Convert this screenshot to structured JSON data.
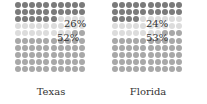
{
  "chart_data": {
    "type": "waffle",
    "grid": {
      "rows": 10,
      "cols": 10
    },
    "colors": {
      "dark": "#7a7a7a",
      "light": "#dcdcdc",
      "medium": "#a8a8a8"
    },
    "panels": [
      {
        "label": "Texas",
        "segments": [
          {
            "key": "dark",
            "value": 26
          },
          {
            "key": "light",
            "value": 22
          },
          {
            "key": "medium",
            "value": 52
          }
        ],
        "annotations": [
          "26%",
          "52%"
        ]
      },
      {
        "label": "Florida",
        "segments": [
          {
            "key": "dark",
            "value": 24
          },
          {
            "key": "light",
            "value": 23
          },
          {
            "key": "medium",
            "value": 53
          }
        ],
        "annotations": [
          "24%",
          "53%"
        ]
      }
    ]
  },
  "panels": [
    {
      "label": "Texas",
      "pct_top": "26%",
      "pct_bottom": "52%"
    },
    {
      "label": "Florida",
      "pct_top": "24%",
      "pct_bottom": "53%"
    }
  ]
}
